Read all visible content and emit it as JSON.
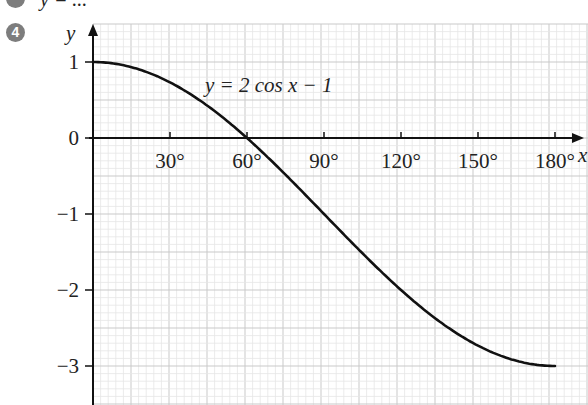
{
  "problem": {
    "number": "4",
    "cropped_previous_text": "y = ..."
  },
  "chart_data": {
    "type": "line",
    "title": "",
    "equation_label": "y = 2 cos x − 1",
    "xlabel": "x",
    "ylabel": "y",
    "x_ticks": [
      "30°",
      "60°",
      "90°",
      "120°",
      "150°",
      "180°"
    ],
    "x_tick_values": [
      30,
      60,
      90,
      120,
      150,
      180
    ],
    "y_ticks": [
      "1",
      "0",
      "−1",
      "−2",
      "−3"
    ],
    "y_tick_values": [
      1,
      0,
      -1,
      -2,
      -3
    ],
    "xlim": [
      0,
      190
    ],
    "ylim": [
      -3.5,
      1.5
    ],
    "grid": true,
    "legend": "none",
    "series": [
      {
        "name": "y = 2 cos x − 1",
        "x": [
          0,
          15,
          30,
          45,
          60,
          75,
          90,
          105,
          120,
          135,
          150,
          165,
          180
        ],
        "values": [
          1,
          0.93,
          0.73,
          0.41,
          0,
          -0.48,
          -1,
          -1.52,
          -2,
          -2.41,
          -2.73,
          -2.93,
          -3
        ]
      }
    ]
  }
}
